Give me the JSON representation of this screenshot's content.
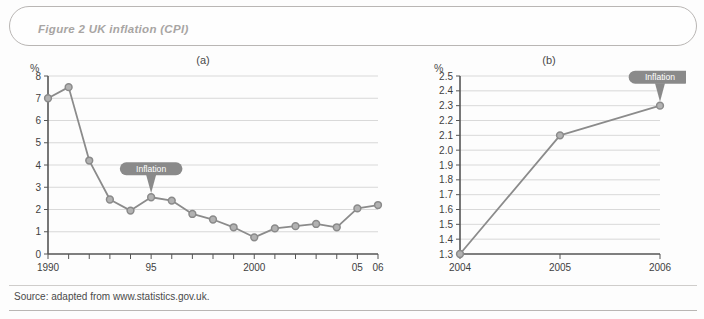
{
  "figure": {
    "title": "Figure 2  UK inflation (CPI)",
    "source": "Source: adapted from www.statistics.gov.uk.",
    "accent_color": "#8b8b8b",
    "marker_color": "#8a8a8a",
    "gridline_color": "#cfcfcf",
    "axis_color": "#555555",
    "title_color": "#a8a5a3",
    "callout_color": "#8a8a8a",
    "callout_text_color": "#ffffff"
  },
  "panels": [
    {
      "id": "a",
      "label": "(a)",
      "unit": "%",
      "callout": "Inflation"
    },
    {
      "id": "b",
      "label": "(b)",
      "unit": "%",
      "callout": "Inflation"
    }
  ],
  "chart_data": [
    {
      "type": "line",
      "panel": "(a)",
      "title": "UK inflation (CPI) 1990-2006",
      "xlabel": "",
      "ylabel": "%",
      "grid": true,
      "legend": "Inflation",
      "legend_position": "callout-on-series",
      "xlim": [
        1990,
        2006
      ],
      "ylim": [
        0,
        8
      ],
      "ytick_step": 1,
      "yticks": [
        "0",
        "1",
        "2",
        "3",
        "4",
        "5",
        "6",
        "7",
        "8"
      ],
      "xtick_years": [
        1990,
        1991,
        1992,
        1993,
        1994,
        1995,
        1996,
        1997,
        1998,
        1999,
        2000,
        2001,
        2002,
        2003,
        2004,
        2005,
        2006
      ],
      "xtick_labels": [
        {
          "year": 1990,
          "label": "1990"
        },
        {
          "year": 1995,
          "label": "95"
        },
        {
          "year": 2000,
          "label": "2000"
        },
        {
          "year": 2005,
          "label": "05"
        },
        {
          "year": 2006,
          "label": "06"
        }
      ],
      "x": [
        1990,
        1991,
        1992,
        1993,
        1994,
        1995,
        1996,
        1997,
        1998,
        1999,
        2000,
        2001,
        2002,
        2003,
        2004,
        2005,
        2006
      ],
      "values": [
        7.0,
        7.5,
        4.2,
        2.45,
        1.95,
        2.55,
        2.4,
        1.8,
        1.55,
        1.2,
        0.75,
        1.15,
        1.25,
        1.35,
        1.2,
        2.05,
        2.2
      ],
      "annotation": {
        "text": "Inflation",
        "points_to_year": 1995,
        "points_to_value": 2.55
      }
    },
    {
      "type": "line",
      "panel": "(b)",
      "title": "UK inflation (CPI) 2004-2006",
      "xlabel": "",
      "ylabel": "%",
      "grid": true,
      "legend": "Inflation",
      "legend_position": "callout-on-series",
      "xlim": [
        2004,
        2006
      ],
      "ylim": [
        1.3,
        2.5
      ],
      "ytick_step": 0.1,
      "yticks": [
        "1.3",
        "1.4",
        "1.5",
        "1.6",
        "1.7",
        "1.8",
        "1.9",
        "2.0",
        "2.1",
        "2.2",
        "2.3",
        "2.4",
        "2.5"
      ],
      "xtick_labels": [
        {
          "year": 2004,
          "label": "2004"
        },
        {
          "year": 2005,
          "label": "2005"
        },
        {
          "year": 2006,
          "label": "2006"
        }
      ],
      "x": [
        2004,
        2005,
        2006
      ],
      "values": [
        1.3,
        2.1,
        2.3
      ],
      "annotation": {
        "text": "Inflation",
        "points_to_year": 2006,
        "points_to_value": 2.3
      }
    }
  ]
}
